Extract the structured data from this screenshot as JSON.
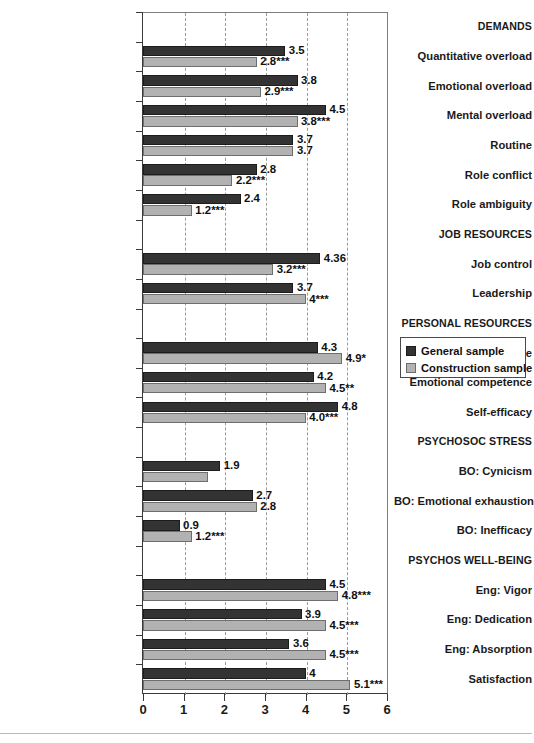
{
  "chart_data": {
    "type": "bar",
    "orientation": "horizontal",
    "title": "",
    "xlabel": "",
    "ylabel": "",
    "xlim": [
      0,
      6
    ],
    "xticks": [
      "0",
      "1",
      "2",
      "3",
      "4",
      "5",
      "6"
    ],
    "grid": "vertical dashed gridlines at each integer",
    "legend_position": "right-middle",
    "series": [
      {
        "name": "General sample",
        "color": "#333333",
        "values": [
          3.5,
          3.8,
          4.5,
          3.7,
          2.8,
          2.4,
          4.36,
          3.7,
          4.3,
          4.2,
          4.8,
          1.9,
          2.7,
          0.9,
          4.5,
          3.9,
          3.6,
          4.0
        ]
      },
      {
        "name": "Construction sample",
        "color": "#b2b2b2",
        "values": [
          2.8,
          2.9,
          3.8,
          3.7,
          2.2,
          1.2,
          3.2,
          4.0,
          4.9,
          4.5,
          4.0,
          1.6,
          2.8,
          1.2,
          4.8,
          4.5,
          4.5,
          5.1
        ]
      }
    ],
    "rows": [
      {
        "kind": "category",
        "label": "DEMANDS"
      },
      {
        "kind": "item",
        "label": "Quantitative overload",
        "general": 3.5,
        "general_label": "3.5",
        "construction": 2.8,
        "construction_label": "2.8***"
      },
      {
        "kind": "item",
        "label": "Emotional overload",
        "general": 3.8,
        "general_label": "3.8",
        "construction": 2.9,
        "construction_label": "2.9***"
      },
      {
        "kind": "item",
        "label": "Mental overload",
        "general": 4.5,
        "general_label": "4.5",
        "construction": 3.8,
        "construction_label": "3.8***"
      },
      {
        "kind": "item",
        "label": "Routine",
        "general": 3.7,
        "general_label": "3.7",
        "construction": 3.7,
        "construction_label": "3.7"
      },
      {
        "kind": "item",
        "label": "Role conflict",
        "general": 2.8,
        "general_label": "2.8",
        "construction": 2.2,
        "construction_label": "2.2***"
      },
      {
        "kind": "item",
        "label": "Role ambiguity",
        "general": 2.4,
        "general_label": "2.4",
        "construction": 1.2,
        "construction_label": "1.2***"
      },
      {
        "kind": "category",
        "label": "JOB RESOURCES"
      },
      {
        "kind": "item",
        "label": "Job control",
        "general": 4.36,
        "general_label": "4.36",
        "construction": 3.2,
        "construction_label": "3.2***"
      },
      {
        "kind": "item",
        "label": "Leadership",
        "general": 3.7,
        "general_label": "3.7",
        "construction": 4.0,
        "construction_label": "4***"
      },
      {
        "kind": "category",
        "label": "PERSONAL RESOURCES"
      },
      {
        "kind": "item",
        "label": "Mental competence",
        "general": 4.3,
        "general_label": "4.3",
        "construction": 4.9,
        "construction_label": "4.9*"
      },
      {
        "kind": "item",
        "label": "Emotional competence",
        "general": 4.2,
        "general_label": "4.2",
        "construction": 4.5,
        "construction_label": "4.5**"
      },
      {
        "kind": "item",
        "label": "Self-efficacy",
        "general": 4.8,
        "general_label": "4.8",
        "construction": 4.0,
        "construction_label": "4.0***"
      },
      {
        "kind": "category",
        "label": "PSYCHOSOC STRESS"
      },
      {
        "kind": "item",
        "label": "BO: Cynicism",
        "general": 1.9,
        "general_label": "1.9",
        "construction": 1.6,
        "construction_label": ""
      },
      {
        "kind": "item",
        "label": "BO: Emotional exhaustion",
        "general": 2.7,
        "general_label": "2.7",
        "construction": 2.8,
        "construction_label": "2.8"
      },
      {
        "kind": "item",
        "label": "BO: Inefficacy",
        "general": 0.9,
        "general_label": "0.9",
        "construction": 1.2,
        "construction_label": "1.2***"
      },
      {
        "kind": "category",
        "label": "PSYCHOS WELL-BEING"
      },
      {
        "kind": "item",
        "label": "Eng: Vigor",
        "general": 4.5,
        "general_label": "4.5",
        "construction": 4.8,
        "construction_label": "4.8***"
      },
      {
        "kind": "item",
        "label": "Eng: Dedication",
        "general": 3.9,
        "general_label": "3.9",
        "construction": 4.5,
        "construction_label": "4.5***"
      },
      {
        "kind": "item",
        "label": "Eng: Absorption",
        "general": 3.6,
        "general_label": "3.6",
        "construction": 4.5,
        "construction_label": "4.5***"
      },
      {
        "kind": "item",
        "label": "Satisfaction",
        "general": 4.0,
        "general_label": "4",
        "construction": 5.1,
        "construction_label": "5.1***"
      }
    ]
  },
  "legend": {
    "items": [
      {
        "label": "General sample",
        "color": "#333333"
      },
      {
        "label": "Construction sample",
        "color": "#b2b2b2"
      }
    ]
  },
  "axis": {
    "x_tick_labels": [
      "0",
      "1",
      "2",
      "3",
      "4",
      "5",
      "6"
    ]
  }
}
